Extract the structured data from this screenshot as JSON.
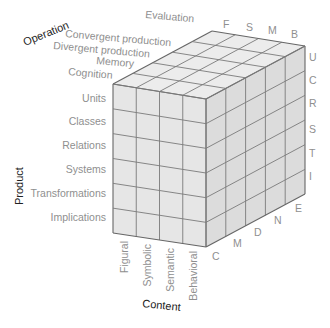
{
  "axes": {
    "operation": {
      "title": "Operation",
      "items": [
        "Evaluation",
        "Convergent production",
        "Divergent production",
        "Memory",
        "Cognition"
      ],
      "abbrev": []
    },
    "product": {
      "title": "Product",
      "items": [
        "Units",
        "Classes",
        "Relations",
        "Systems",
        "Transformations",
        "Implications"
      ],
      "abbrev": [
        "U",
        "C",
        "R",
        "S",
        "T",
        "I"
      ]
    },
    "content": {
      "title": "Content",
      "items": [
        "Figural",
        "Symbolic",
        "Semantic",
        "Behavioral"
      ],
      "abbrev_top": [
        "F",
        "S",
        "M",
        "B"
      ]
    },
    "operation_abbrev": [
      "C",
      "M",
      "D",
      "N",
      "E"
    ]
  },
  "colors": {
    "label": "#8f8f8f",
    "axis_title": "#222222",
    "face_front": "#e6e6e6",
    "face_top": "#ececec",
    "face_side": "#dcdcdc",
    "grid": "#7a7a7a"
  }
}
